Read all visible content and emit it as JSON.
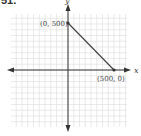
{
  "exercise_number": "51.",
  "chart_data": {
    "type": "line",
    "title": "",
    "xlabel": "x",
    "ylabel": "y",
    "grid": true,
    "series": [
      {
        "name": "segment",
        "x": [
          0,
          500
        ],
        "y": [
          500,
          0
        ]
      }
    ],
    "points": [
      {
        "label": "(0, 500)",
        "x": 0,
        "y": 500
      },
      {
        "label": "(500, 0)",
        "x": 500,
        "y": 0
      }
    ],
    "xlim": [
      -700,
      700
    ],
    "ylim": [
      -700,
      550
    ],
    "tick_labels": []
  },
  "labels": {
    "point_a": "(0, 500)",
    "point_b": "(500, 0)",
    "x_axis": "x",
    "y_axis": "y"
  },
  "colors": {
    "grid": "#d9d9d9",
    "axis": "#333333",
    "line": "#444444"
  }
}
